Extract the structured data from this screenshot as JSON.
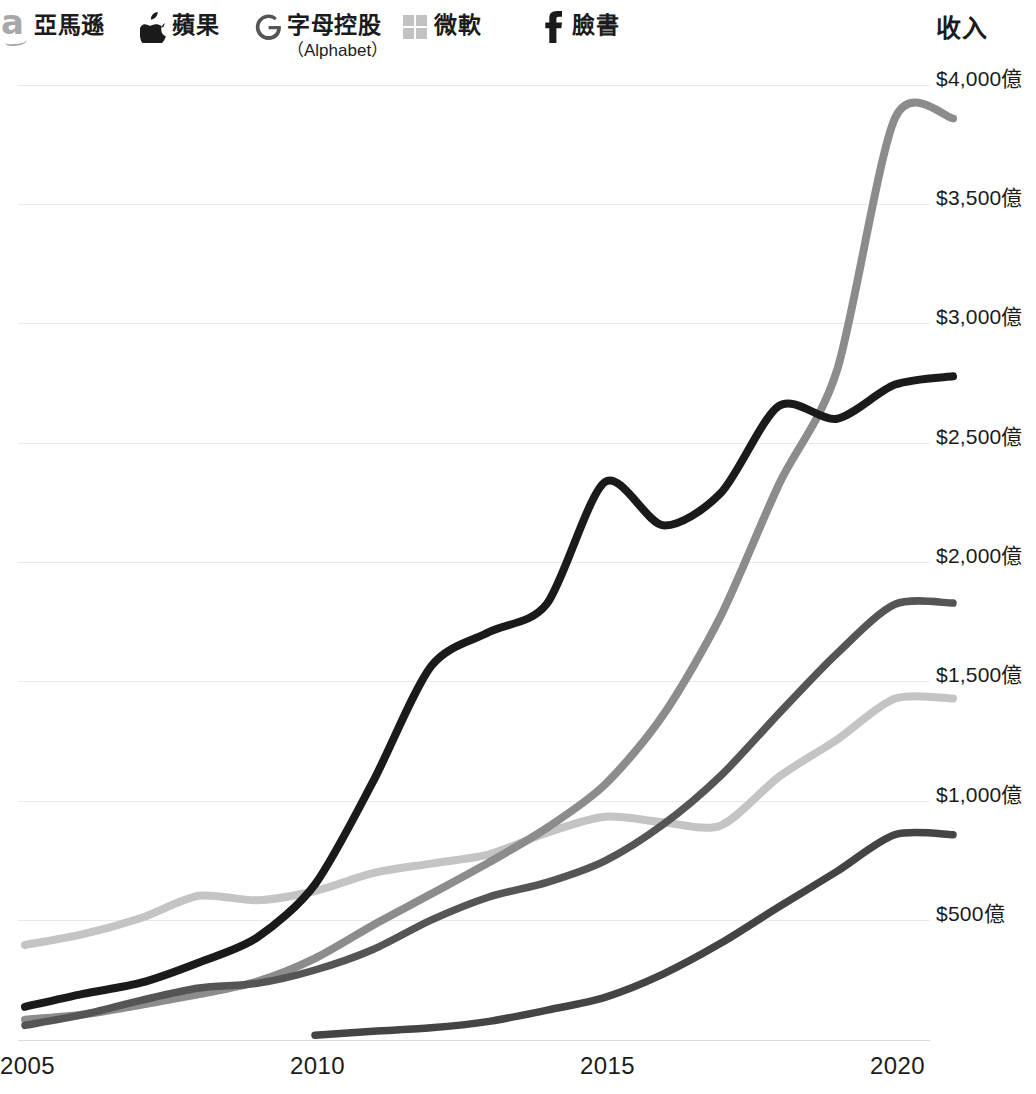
{
  "legend": {
    "items": [
      {
        "key": "amazon",
        "label": "亞馬遜",
        "sub": "",
        "icon": "amazon-logo-icon",
        "color": "#8c8c8c"
      },
      {
        "key": "apple",
        "label": "蘋果",
        "sub": "",
        "icon": "apple-logo-icon",
        "color": "#1a1a1a"
      },
      {
        "key": "alphabet",
        "label": "字母控股",
        "sub": "（Alphabet）",
        "icon": "google-g-logo-icon",
        "color": "#555555"
      },
      {
        "key": "microsoft",
        "label": "微軟",
        "sub": "",
        "icon": "microsoft-squares-logo-icon",
        "color": "#c4c4c4"
      },
      {
        "key": "facebook",
        "label": "臉書",
        "sub": "",
        "icon": "facebook-f-logo-icon",
        "color": "#444444"
      }
    ]
  },
  "axis": {
    "y_title": "收入",
    "y_ticks": [
      "$4,000億",
      "$3,500億",
      "$3,000億",
      "$2,500億",
      "$2,000億",
      "$1,500億",
      "$1,000億",
      "$500億"
    ],
    "x_ticks": [
      "2005",
      "2010",
      "2015",
      "2020"
    ]
  },
  "chart_data": {
    "type": "line",
    "title": "收入",
    "xlabel": "",
    "ylabel": "收入",
    "xlim": [
      2005,
      2021
    ],
    "ylim": [
      0,
      4000
    ],
    "grid": true,
    "legend_position": "top",
    "unit": "億美元",
    "x": [
      2005,
      2006,
      2007,
      2008,
      2009,
      2010,
      2011,
      2012,
      2013,
      2014,
      2015,
      2016,
      2017,
      2018,
      2019,
      2020,
      2021
    ],
    "series": [
      {
        "name": "亞馬遜",
        "english": "Amazon",
        "color": "#8c8c8c",
        "values": [
          85,
          107,
          148,
          192,
          245,
          342,
          481,
          611,
          744,
          889,
          1070,
          1360,
          1778,
          2328,
          2805,
          3861,
          3860
        ]
      },
      {
        "name": "蘋果",
        "english": "Apple",
        "color": "#1a1a1a",
        "values": [
          139,
          193,
          240,
          325,
          429,
          652,
          1082,
          1565,
          1709,
          1828,
          2337,
          2156,
          2292,
          2656,
          2602,
          2745,
          2780
        ]
      },
      {
        "name": "字母控股",
        "english": "Alphabet",
        "color": "#555555",
        "values": [
          61,
          106,
          166,
          218,
          237,
          293,
          379,
          502,
          599,
          660,
          750,
          902,
          1108,
          1368,
          1619,
          1825,
          1830
        ]
      },
      {
        "name": "微軟",
        "english": "Microsoft",
        "color": "#c4c4c4",
        "values": [
          398,
          443,
          511,
          604,
          585,
          624,
          699,
          739,
          778,
          868,
          935,
          912,
          899,
          1103,
          1258,
          1430,
          1430
        ]
      },
      {
        "name": "臉書",
        "english": "Facebook",
        "color": "#444444",
        "values": [
          null,
          null,
          null,
          null,
          null,
          20,
          37,
          51,
          78,
          125,
          179,
          276,
          406,
          558,
          706,
          860,
          860
        ]
      }
    ]
  }
}
